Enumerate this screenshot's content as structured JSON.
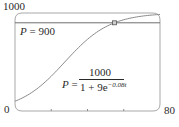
{
  "chart_data": {
    "type": "line",
    "title": "",
    "xlabel": "",
    "ylabel": "",
    "xlim": [
      0,
      80
    ],
    "ylim": [
      0,
      1000
    ],
    "x_tick_labels": [
      "0",
      "80"
    ],
    "x_ticks": [
      0,
      20,
      40,
      60,
      80
    ],
    "y_tick_labels": [
      "1000"
    ],
    "grid": false,
    "legend": null,
    "series": [
      {
        "name": "P = 1000 / (1 + 9e^(-0.08t))",
        "kind": "logistic",
        "formula": {
          "L": 1000,
          "A": 9,
          "k": 0.08
        },
        "x": [
          0,
          5,
          10,
          15,
          20,
          25,
          30,
          35,
          40,
          45,
          50,
          55,
          60,
          65,
          70,
          75,
          80
        ],
        "values": [
          100,
          142,
          198,
          267,
          353,
          450,
          550,
          645,
          730,
          801,
          858,
          900,
          932,
          954,
          969,
          979,
          986
        ]
      },
      {
        "name": "P = 900",
        "kind": "horizontal-line",
        "x": [
          0,
          80
        ],
        "values": [
          900,
          900
        ]
      }
    ],
    "annotations": [
      {
        "text": "P = 900",
        "position": "upper-left, below the horizontal line"
      },
      {
        "text": "P = 1000 / (1 + 9e^{-0.08t})",
        "position": "center-right"
      },
      {
        "text": "intersection marker",
        "x": 54.9,
        "y": 900,
        "marker": "square"
      }
    ]
  },
  "labels": {
    "y_top": "1000",
    "origin": "0",
    "x_right": "80",
    "hline_label_var": "P",
    "hline_label_eq": " = 900",
    "eq_lhs_var": "P",
    "eq_lhs_eq": " =",
    "eq_numerator": "1000",
    "eq_denom_base": "1 + 9e",
    "eq_denom_exp": "−0.08t"
  },
  "colors": {
    "axis": "#9a9a9a",
    "curve": "#8a8a8a",
    "hline": "#6e6e6e",
    "text": "#2a2a2a"
  }
}
